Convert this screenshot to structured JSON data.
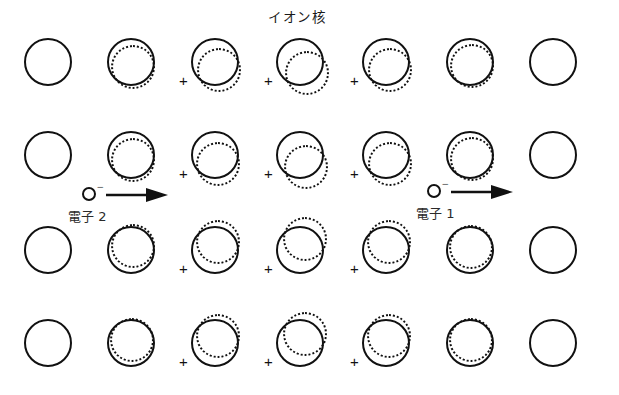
{
  "figure": {
    "title": "イオン核",
    "title_pos": {
      "x": 268,
      "y": 6
    },
    "width": 619,
    "height": 395,
    "background": "#ffffff",
    "ink_color": "#111111"
  },
  "lattice": {
    "columns": 7,
    "rows": 4,
    "column_centers_px": [
      48,
      131,
      215,
      300,
      386,
      470,
      553
    ],
    "row_centers_px": [
      62,
      155,
      250,
      343
    ],
    "ion_core_diameter_px": 48,
    "electron_cloud_diameter_px": 44,
    "plus_label": "+",
    "cells": [
      [
        {
          "dx": 0,
          "dy": 0,
          "cloud": false,
          "plus": false
        },
        {
          "dx": 2,
          "dy": 5,
          "cloud": true,
          "plus": false
        },
        {
          "dx": 4,
          "dy": 8,
          "cloud": true,
          "plus": true
        },
        {
          "dx": 7,
          "dy": 11,
          "cloud": true,
          "plus": true
        },
        {
          "dx": 4,
          "dy": 8,
          "cloud": true,
          "plus": true
        },
        {
          "dx": 2,
          "dy": 4,
          "cloud": true,
          "plus": false
        },
        {
          "dx": 0,
          "dy": 0,
          "cloud": false,
          "plus": false
        }
      ],
      [
        {
          "dx": 0,
          "dy": 0,
          "cloud": false,
          "plus": false
        },
        {
          "dx": 2,
          "dy": 5,
          "cloud": true,
          "plus": false
        },
        {
          "dx": 3,
          "dy": 9,
          "cloud": true,
          "plus": true
        },
        {
          "dx": 6,
          "dy": 12,
          "cloud": true,
          "plus": true
        },
        {
          "dx": 4,
          "dy": 9,
          "cloud": true,
          "plus": true
        },
        {
          "dx": 2,
          "dy": 4,
          "cloud": true,
          "plus": false
        },
        {
          "dx": 0,
          "dy": 0,
          "cloud": false,
          "plus": false
        }
      ],
      [
        {
          "dx": 0,
          "dy": 0,
          "cloud": false,
          "plus": false
        },
        {
          "dx": 2,
          "dy": -4,
          "cloud": true,
          "plus": false
        },
        {
          "dx": 3,
          "dy": -8,
          "cloud": true,
          "plus": true
        },
        {
          "dx": 5,
          "dy": -11,
          "cloud": true,
          "plus": true
        },
        {
          "dx": 3,
          "dy": -8,
          "cloud": true,
          "plus": true
        },
        {
          "dx": 1,
          "dy": -3,
          "cloud": true,
          "plus": false
        },
        {
          "dx": 0,
          "dy": 0,
          "cloud": false,
          "plus": false
        }
      ],
      [
        {
          "dx": 0,
          "dy": 0,
          "cloud": false,
          "plus": false
        },
        {
          "dx": 1,
          "dy": -3,
          "cloud": true,
          "plus": false
        },
        {
          "dx": 3,
          "dy": -7,
          "cloud": true,
          "plus": true
        },
        {
          "dx": 5,
          "dy": -9,
          "cloud": true,
          "plus": true
        },
        {
          "dx": 3,
          "dy": -7,
          "cloud": true,
          "plus": true
        },
        {
          "dx": 1,
          "dy": -3,
          "cloud": true,
          "plus": false
        },
        {
          "dx": 0,
          "dy": 0,
          "cloud": false,
          "plus": false
        }
      ]
    ]
  },
  "electrons": [
    {
      "id": "electron-2",
      "label": "電子 2",
      "charge": "−",
      "x": 82,
      "y": 183,
      "label_x": 68,
      "label_y": 206
    },
    {
      "id": "electron-1",
      "label": "電子 1",
      "charge": "−",
      "x": 427,
      "y": 180,
      "label_x": 416,
      "label_y": 203
    }
  ]
}
